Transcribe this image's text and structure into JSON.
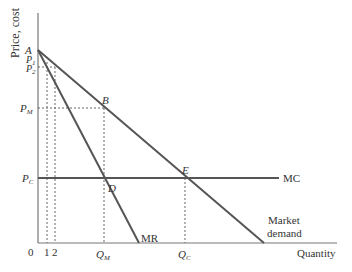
{
  "diagram": {
    "y_axis_label": "Price, cost",
    "x_axis_label": "Quantity",
    "origin_label": "0",
    "x_ticks": {
      "q1": "1",
      "q2": "2",
      "qm": "Q",
      "qm_sub": "M",
      "qc": "Q",
      "qc_sub": "C"
    },
    "y_ticks": {
      "a": "A",
      "p1": "P",
      "p1_sub": "1",
      "p2": "P",
      "p2_sub": "2",
      "pm": "P",
      "pm_sub": "M",
      "pc": "P",
      "pc_sub": "C"
    },
    "points": {
      "b": "B",
      "d": "D",
      "e": "E"
    },
    "curves": {
      "mc": "MC",
      "mr": "MR",
      "demand_line1": "Market",
      "demand_line2": "demand"
    },
    "colors": {
      "curve": "#555555",
      "axis": "#777777",
      "dashed": "#666666",
      "text": "#333333"
    }
  }
}
